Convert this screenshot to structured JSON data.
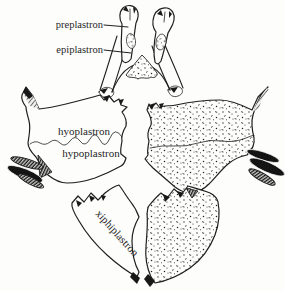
{
  "diagram": {
    "labels": {
      "preplastron": "preplastron",
      "epiplastron": "epiplastron",
      "hyoplastron": "hyoplastron",
      "hypoplastron": "hypoplastron",
      "xiphiplastron": "xiphiplastron"
    },
    "colors": {
      "ink": "#1f1f1f",
      "paper": "#fdfdfc",
      "stipple_dot": "#222222",
      "claw_black": "#141414"
    }
  }
}
